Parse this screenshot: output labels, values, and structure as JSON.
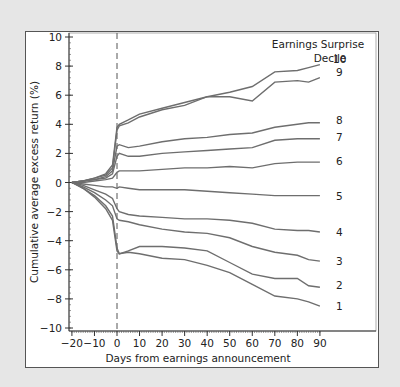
{
  "chart_data": {
    "type": "line",
    "title": "",
    "xlabel": "Days from earnings announcement",
    "ylabel": "Cumulative average excess return (%)",
    "legend_title": [
      "Earnings Surprise",
      "Decile"
    ],
    "xlim": [
      -20,
      90
    ],
    "ylim": [
      -10,
      10
    ],
    "x_ticks": [
      -20,
      -10,
      0,
      10,
      20,
      30,
      40,
      50,
      60,
      70,
      80,
      90
    ],
    "x_tick_labels": [
      "−20",
      "−10",
      "0",
      "10",
      "20",
      "30",
      "40",
      "50",
      "60",
      "70",
      "80",
      "90"
    ],
    "y_ticks": [
      10,
      8,
      6,
      4,
      2,
      0,
      -2,
      -4,
      -6,
      -8,
      -10
    ],
    "y_tick_labels": [
      "10",
      "8",
      "6",
      "4",
      "2",
      "0",
      "−2",
      "−4",
      "−6",
      "−8",
      "−10"
    ],
    "grid": false,
    "annotation": "vertical dashed line at day 0",
    "x": [
      -20,
      -15,
      -10,
      -5,
      -2,
      0,
      1,
      5,
      10,
      20,
      30,
      40,
      50,
      60,
      70,
      80,
      85,
      90
    ],
    "series": [
      {
        "name": "10",
        "values": [
          0,
          0.1,
          0.3,
          0.6,
          1.2,
          3.8,
          4.0,
          4.3,
          4.7,
          5.1,
          5.5,
          5.9,
          6.2,
          6.6,
          7.6,
          7.7,
          7.9,
          8.1
        ]
      },
      {
        "name": "9",
        "values": [
          0,
          0.1,
          0.3,
          0.5,
          1.0,
          3.6,
          3.9,
          4.1,
          4.5,
          5.0,
          5.3,
          5.9,
          5.9,
          5.6,
          6.9,
          7.0,
          6.9,
          7.2
        ]
      },
      {
        "name": "8",
        "values": [
          0,
          0.1,
          0.2,
          0.4,
          0.8,
          2.5,
          2.6,
          2.4,
          2.5,
          2.8,
          3.0,
          3.1,
          3.3,
          3.4,
          3.8,
          4.0,
          4.1,
          4.1
        ]
      },
      {
        "name": "7",
        "values": [
          0,
          0.1,
          0.2,
          0.3,
          0.6,
          1.8,
          2.0,
          1.8,
          1.8,
          2.0,
          2.1,
          2.2,
          2.3,
          2.4,
          2.9,
          3.0,
          3.0,
          3.0
        ]
      },
      {
        "name": "6",
        "values": [
          0,
          0.0,
          0.1,
          0.2,
          0.3,
          0.7,
          0.8,
          0.8,
          0.8,
          0.9,
          1.0,
          1.0,
          1.1,
          1.0,
          1.3,
          1.4,
          1.4,
          1.4
        ]
      },
      {
        "name": "5",
        "values": [
          0,
          -0.1,
          -0.2,
          -0.3,
          -0.3,
          -0.4,
          -0.3,
          -0.4,
          -0.5,
          -0.5,
          -0.5,
          -0.6,
          -0.7,
          -0.8,
          -0.9,
          -0.9,
          -0.9,
          -0.9
        ]
      },
      {
        "name": "4",
        "values": [
          0,
          -0.2,
          -0.5,
          -0.8,
          -1.1,
          -1.8,
          -2.0,
          -2.2,
          -2.3,
          -2.4,
          -2.5,
          -2.5,
          -2.6,
          -2.8,
          -3.2,
          -3.3,
          -3.3,
          -3.4
        ]
      },
      {
        "name": "3",
        "values": [
          0,
          -0.3,
          -0.7,
          -1.2,
          -1.6,
          -2.5,
          -2.6,
          -2.7,
          -2.9,
          -3.2,
          -3.4,
          -3.5,
          -3.8,
          -4.4,
          -4.8,
          -5.0,
          -5.3,
          -5.4
        ]
      },
      {
        "name": "2",
        "values": [
          0,
          -0.4,
          -0.9,
          -1.6,
          -2.3,
          -4.5,
          -4.9,
          -4.7,
          -4.4,
          -4.4,
          -4.5,
          -4.7,
          -5.5,
          -6.3,
          -6.6,
          -6.6,
          -7.1,
          -7.2
        ]
      },
      {
        "name": "1",
        "values": [
          0,
          -0.4,
          -1.0,
          -1.8,
          -2.6,
          -4.7,
          -4.9,
          -4.8,
          -4.9,
          -5.2,
          -5.3,
          -5.7,
          -6.2,
          -7.0,
          -7.8,
          -8.0,
          -8.2,
          -8.5
        ]
      }
    ]
  },
  "labels": {
    "legend_title_line1": "Earnings Surprise",
    "legend_title_line2": "Decile",
    "xlabel": "Days from earnings announcement",
    "ylabel": "Cumulative average excess return (%)"
  },
  "colors": {
    "line": "#6e6e6e",
    "background": "#e6e6e6",
    "panel": "#ffffff"
  }
}
